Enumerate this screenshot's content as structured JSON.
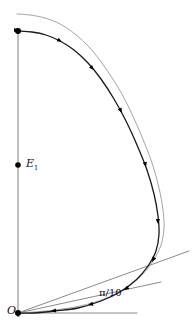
{
  "figure": {
    "type": "geometric-diagram",
    "background_color": "#ffffff"
  },
  "labels": {
    "origin": {
      "text": "O",
      "subscript": "1",
      "x": 7,
      "y": 305
    },
    "focus": {
      "text": "E",
      "subscript": "1",
      "x": 26,
      "y": 158
    },
    "angle": {
      "text": "π/10",
      "x": 99,
      "y": 288
    }
  },
  "colors": {
    "axis": "#8a8a8a",
    "ray": "#8a8a8a",
    "outer_curve": "#9a9a9a",
    "trajectory": "#1a1a1a",
    "marker": "#000000",
    "label": "#111111"
  },
  "points": [
    {
      "name": "origin-point",
      "x": 18,
      "y": 313,
      "radius": 3.0
    },
    {
      "name": "focus-point",
      "x": 18,
      "y": 165,
      "radius": 2.8
    },
    {
      "name": "apex-point",
      "x": 18,
      "y": 31,
      "radius": 3.0
    }
  ],
  "axis": {
    "name": "vertical-axis",
    "x1": 18,
    "y1": 313,
    "x2": 18,
    "y2": 31,
    "width": 1.1
  },
  "rays": [
    {
      "name": "horizontal-ray",
      "x1": 18,
      "y1": 313,
      "x2": 137,
      "y2": 313,
      "width": 1.0
    },
    {
      "name": "shallow-ray",
      "x1": 18,
      "y1": 313,
      "x2": 161,
      "y2": 282,
      "width": 1.0
    },
    {
      "name": "steep-ray",
      "x1": 18,
      "y1": 313,
      "x2": 189,
      "y2": 251,
      "width": 1.0
    }
  ],
  "chart_data": {
    "type": "line",
    "title": "",
    "xlabel": "",
    "ylabel": "",
    "grid": false,
    "legend": "none",
    "series": [
      {
        "name": "outer-reference-curve",
        "color": "#9a9a9a",
        "width": 0.9,
        "closed": false,
        "points": [
          [
            17,
            14
          ],
          [
            30,
            15
          ],
          [
            45,
            18
          ],
          [
            60,
            24
          ],
          [
            75,
            34
          ],
          [
            90,
            48
          ],
          [
            104,
            66
          ],
          [
            119,
            89
          ],
          [
            131,
            112
          ],
          [
            142,
            137
          ],
          [
            152,
            163
          ],
          [
            159,
            188
          ],
          [
            163,
            210
          ],
          [
            164,
            228
          ],
          [
            161,
            245
          ],
          [
            153,
            261
          ],
          [
            141,
            276
          ],
          [
            124,
            289
          ],
          [
            104,
            299
          ],
          [
            80,
            306
          ],
          [
            55,
            310
          ],
          [
            33,
            312
          ],
          [
            19,
            313
          ]
        ]
      },
      {
        "name": "trajectory-curve",
        "color": "#1a1a1a",
        "width": 1.3,
        "closed": false,
        "points": [
          [
            18,
            31
          ],
          [
            32,
            32
          ],
          [
            46,
            35
          ],
          [
            60,
            41
          ],
          [
            74,
            50
          ],
          [
            88,
            63
          ],
          [
            101,
            79
          ],
          [
            114,
            99
          ],
          [
            126,
            121
          ],
          [
            137,
            145
          ],
          [
            147,
            170
          ],
          [
            154,
            194
          ],
          [
            158,
            216
          ],
          [
            159,
            234
          ],
          [
            156,
            251
          ],
          [
            148,
            266
          ],
          [
            136,
            280
          ],
          [
            120,
            292
          ],
          [
            101,
            301
          ],
          [
            78,
            308
          ],
          [
            55,
            311
          ],
          [
            34,
            313
          ],
          [
            19,
            313
          ]
        ]
      }
    ],
    "markers": [
      {
        "name": "arrow-marker",
        "x": 21,
        "y": 31,
        "angle": 4
      },
      {
        "name": "arrow-marker",
        "x": 62,
        "y": 42,
        "angle": 30
      },
      {
        "name": "arrow-marker",
        "x": 94,
        "y": 70,
        "angle": 46
      },
      {
        "name": "arrow-marker",
        "x": 122,
        "y": 113,
        "angle": 62
      },
      {
        "name": "arrow-marker",
        "x": 146,
        "y": 167,
        "angle": 76
      },
      {
        "name": "arrow-marker",
        "x": 158,
        "y": 224,
        "angle": 88
      },
      {
        "name": "arrow-marker",
        "x": 152,
        "y": 262,
        "angle": 118
      },
      {
        "name": "arrow-marker",
        "x": 124,
        "y": 290,
        "angle": 147
      },
      {
        "name": "arrow-marker",
        "x": 88,
        "y": 305,
        "angle": 166
      },
      {
        "name": "arrow-marker",
        "x": 51,
        "y": 311,
        "angle": 174
      },
      {
        "name": "arrow-marker",
        "x": 19,
        "y": 30,
        "angle": 0
      }
    ]
  }
}
